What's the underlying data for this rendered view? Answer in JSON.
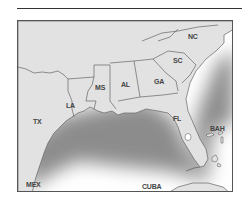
{
  "map": {
    "title": "",
    "colors": {
      "land": "#e4e4e4",
      "water": "#ffffff",
      "shore_shadow": "#8a8a8a",
      "border": "#555555"
    },
    "labels": {
      "nc": "NC",
      "sc": "SC",
      "ga": "GA",
      "al": "AL",
      "ms": "MS",
      "la": "LA",
      "tx": "TX",
      "fl": "FL",
      "bah": "BAH",
      "mex": "MEX",
      "cuba": "CUBA"
    }
  }
}
